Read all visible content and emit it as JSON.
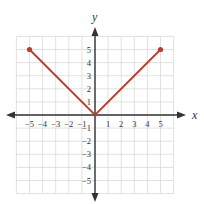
{
  "chart_data": {
    "type": "line",
    "title": "",
    "xlabel": "x",
    "ylabel": "y",
    "xlim": [
      -6,
      6
    ],
    "ylim": [
      -6,
      6
    ],
    "grid": true,
    "x_ticks": [
      "-5",
      "-4",
      "-3",
      "-2",
      "-1",
      "1",
      "2",
      "3",
      "4",
      "5"
    ],
    "y_ticks": [
      "5",
      "4",
      "3",
      "2",
      "1",
      "-1",
      "-2",
      "-3",
      "-4",
      "-5"
    ],
    "series": [
      {
        "name": "y = |x|",
        "color": "#c0392b",
        "points": [
          [
            -5,
            5
          ],
          [
            0,
            0
          ],
          [
            5,
            5
          ]
        ],
        "endpoints": [
          [
            -5,
            5
          ],
          [
            5,
            5
          ]
        ]
      }
    ]
  },
  "colors": {
    "line": "#c0392b",
    "grid": "#d9d9d9",
    "axis": "#333333"
  }
}
